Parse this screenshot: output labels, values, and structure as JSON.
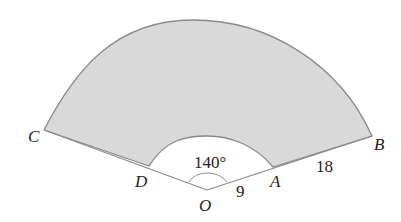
{
  "diagram": {
    "type": "annular sector",
    "points": {
      "O": "O",
      "A": "A",
      "B": "B",
      "C": "C",
      "D": "D"
    },
    "angle_label": "140°",
    "inner_length_label": "9",
    "outer_segment_label": "18",
    "colors": {
      "fill": "#d9d9d9",
      "stroke": "#8a8a8a",
      "background": "#ffffff",
      "text": "#222222"
    }
  }
}
